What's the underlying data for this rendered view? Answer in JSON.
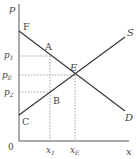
{
  "diagram": {
    "type": "supply-demand",
    "axes": {
      "y_label": "p",
      "x_label": "x",
      "origin_label": "0"
    },
    "curves": {
      "demand": {
        "label": "D",
        "start_point": "F"
      },
      "supply": {
        "label": "S",
        "start_point": "C"
      }
    },
    "points": {
      "F": "F",
      "A": "A",
      "E": "E",
      "B": "B",
      "C": "C"
    },
    "price_ticks": [
      {
        "label": "p",
        "sub": "1"
      },
      {
        "label": "p",
        "sub": "E"
      },
      {
        "label": "p",
        "sub": "2"
      }
    ],
    "quantity_ticks": [
      {
        "label": "x",
        "sub": "1"
      },
      {
        "label": "x",
        "sub": "E"
      }
    ],
    "colors": {
      "axis": "#555555",
      "line": "#333333",
      "guide": "#888888",
      "text": "#444444"
    }
  }
}
